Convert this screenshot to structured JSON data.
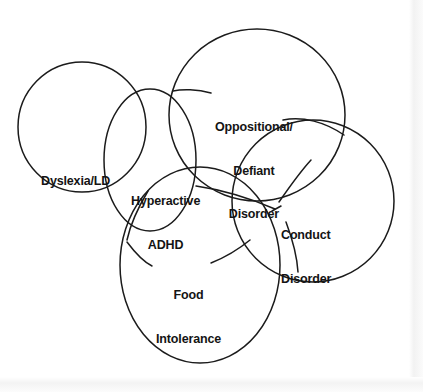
{
  "diagram": {
    "background_color": "#ffffff",
    "stroke_color": "#1b1b1b",
    "text_color": "#141414",
    "type": "venn",
    "labels": {
      "dyslexia": "Dyslexia/LD",
      "odd_line1": "Oppositional/",
      "odd_line2": "Defiant",
      "odd_line3": "Disorder",
      "hyperactive_line1": "Hyperactive",
      "hyperactive_line2": "ADHD",
      "conduct_line1": "Conduct",
      "conduct_line2": "Disorder",
      "food_line1": "Food",
      "food_line2": "Intolerance"
    },
    "sets": [
      {
        "name": "dyslexia-ld",
        "label": "Dyslexia/LD",
        "cx": 82,
        "cy": 127,
        "rx": 64,
        "ry": 65
      },
      {
        "name": "hyperactive-adhd",
        "label": "Hyperactive ADHD",
        "cx": 150,
        "cy": 160,
        "rx": 46,
        "ry": 71
      },
      {
        "name": "oppositional-defiant-disorder",
        "label": "Oppositional/ Defiant Disorder",
        "cx": 257,
        "cy": 115,
        "rx": 88,
        "ry": 86
      },
      {
        "name": "conduct-disorder",
        "label": "Conduct Disorder",
        "cx": 313,
        "cy": 201,
        "rx": 81,
        "ry": 81
      },
      {
        "name": "food-intolerance",
        "label": "Food Intolerance",
        "cx": 200,
        "cy": 265,
        "rx": 80,
        "ry": 98
      }
    ],
    "leader_convergence_points": [
      {
        "name": "top-junction",
        "x": 172,
        "y": 91
      },
      {
        "name": "left-junction",
        "x": 126,
        "y": 241
      },
      {
        "name": "right-junction",
        "x": 276,
        "y": 209
      }
    ]
  }
}
